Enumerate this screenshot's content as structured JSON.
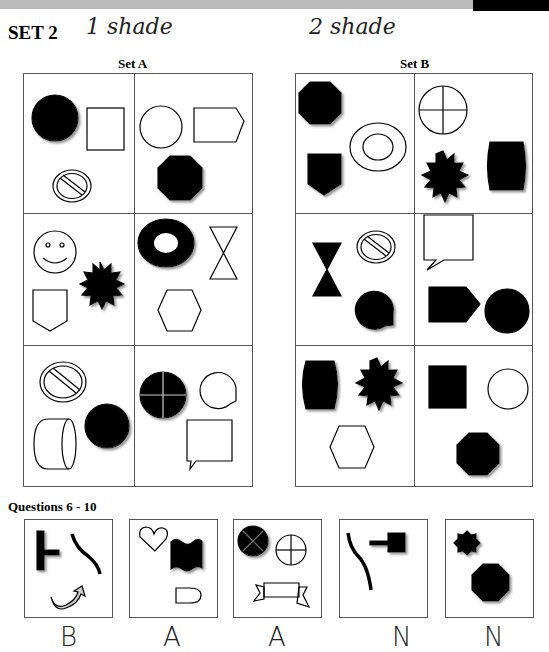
{
  "header": {
    "title": "SET 2",
    "handwritten_note_a": "1 shade",
    "handwritten_note_b": "2 shade"
  },
  "sets": [
    {
      "label": "Set A",
      "cells": [
        [
          "black circle",
          "white square",
          "white no-entry sign"
        ],
        [
          "white circle",
          "white pentagon arrow",
          "black octagon"
        ],
        [
          "white smiley face",
          "black starburst",
          "white shield"
        ],
        [
          "black ring",
          "white hourglass",
          "white hexagon"
        ],
        [
          "white no-entry sign",
          "white cylinder",
          "black circle"
        ],
        [
          "black circle with cross",
          "white round speech bubble",
          "white square speech bubble"
        ]
      ]
    },
    {
      "label": "Set B",
      "cells": [
        [
          "black octagon",
          "black shield",
          "white ring"
        ],
        [
          "white circle with cross",
          "black starburst",
          "black barrel"
        ],
        [
          "black hourglass",
          "white no-entry sign",
          "black round speech bubble"
        ],
        [
          "white square speech bubble",
          "black pentagon arrow",
          "black circle"
        ],
        [
          "black barrel",
          "black starburst",
          "white hexagon"
        ],
        [
          "black square",
          "white circle",
          "black octagon"
        ]
      ]
    }
  ],
  "questions": {
    "label": "Questions 6 - 10",
    "items": [
      {
        "number": 6,
        "shapes": [
          "black T-bar",
          "black curve",
          "gray curved arrow"
        ],
        "answer": "B"
      },
      {
        "number": 7,
        "shapes": [
          "white heart",
          "black wave banner",
          "white D shape"
        ],
        "answer": "A"
      },
      {
        "number": 8,
        "shapes": [
          "black circle with X",
          "white circle with cross",
          "white ribbon scroll"
        ],
        "answer": "A"
      },
      {
        "number": 9,
        "shapes": [
          "black curve",
          "black plunger"
        ],
        "answer": "N"
      },
      {
        "number": 10,
        "shapes": [
          "black 8-point star",
          "black octagon"
        ],
        "answer": "N"
      }
    ]
  }
}
